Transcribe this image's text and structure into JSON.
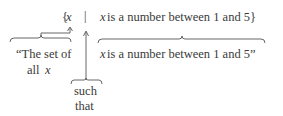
{
  "top_line": {
    "open_brace": "{",
    "var": "x",
    "separator": "|",
    "cond_var": "x",
    "condition": " is a number between 1 and 5}"
  },
  "labels": {
    "set_of_line1": "“The set of",
    "set_of_line2_prefix": "all ",
    "set_of_line2_var": "x",
    "such": "such",
    "that": "that",
    "cond_var": "x",
    "condition": " is a number between 1 and 5”"
  }
}
